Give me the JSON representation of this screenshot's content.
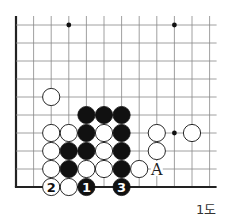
{
  "diagram": {
    "caption": "1도",
    "board": {
      "origin_x": 16,
      "origin_y": 25,
      "col_spacing": 17.6,
      "row_spacing": 18,
      "cols": 12,
      "rows": 10,
      "top_extend": 9,
      "right_extend": 7,
      "left_edge": true,
      "bottom_edge": true,
      "line_color": "#888888",
      "edge_color": "#222222"
    },
    "star_points": [
      {
        "col": 3,
        "row": 0
      },
      {
        "col": 9,
        "row": 0
      },
      {
        "col": 9,
        "row": 6
      }
    ],
    "stones": [
      {
        "col": 2,
        "row": 4,
        "color": "white"
      },
      {
        "col": 4,
        "row": 5,
        "color": "black"
      },
      {
        "col": 5,
        "row": 5,
        "color": "black"
      },
      {
        "col": 6,
        "row": 5,
        "color": "black"
      },
      {
        "col": 2,
        "row": 6,
        "color": "white"
      },
      {
        "col": 3,
        "row": 6,
        "color": "white"
      },
      {
        "col": 4,
        "row": 6,
        "color": "black"
      },
      {
        "col": 5,
        "row": 6,
        "color": "white"
      },
      {
        "col": 6,
        "row": 6,
        "color": "black"
      },
      {
        "col": 8,
        "row": 6,
        "color": "white"
      },
      {
        "col": 10,
        "row": 6,
        "color": "white"
      },
      {
        "col": 2,
        "row": 7,
        "color": "white"
      },
      {
        "col": 3,
        "row": 7,
        "color": "black"
      },
      {
        "col": 4,
        "row": 7,
        "color": "black"
      },
      {
        "col": 5,
        "row": 7,
        "color": "white"
      },
      {
        "col": 6,
        "row": 7,
        "color": "black"
      },
      {
        "col": 8,
        "row": 7,
        "color": "white"
      },
      {
        "col": 2,
        "row": 8,
        "color": "white"
      },
      {
        "col": 3,
        "row": 8,
        "color": "black"
      },
      {
        "col": 4,
        "row": 8,
        "color": "white"
      },
      {
        "col": 5,
        "row": 8,
        "color": "white"
      },
      {
        "col": 6,
        "row": 8,
        "color": "black"
      },
      {
        "col": 7,
        "row": 8,
        "color": "white"
      },
      {
        "col": 2,
        "row": 9,
        "color": "white",
        "label": "2"
      },
      {
        "col": 3,
        "row": 9,
        "color": "white"
      },
      {
        "col": 4,
        "row": 9,
        "color": "black",
        "label": "1"
      },
      {
        "col": 6,
        "row": 9,
        "color": "black",
        "label": "3"
      }
    ],
    "markers": [
      {
        "col": 8,
        "row": 8,
        "label": "A"
      }
    ]
  }
}
